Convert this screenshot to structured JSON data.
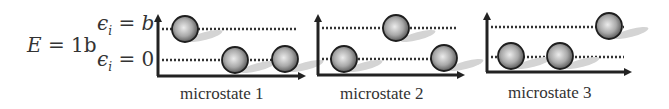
{
  "total_energy": {
    "symbol": "E",
    "equals": "=",
    "value": "1b"
  },
  "levels": [
    {
      "symbol": "ϵ",
      "subscript": "i",
      "equals": "=",
      "value": "b"
    },
    {
      "symbol": "ϵ",
      "subscript": "i",
      "equals": "=",
      "value": "0"
    }
  ],
  "microstates": [
    {
      "label": "microstate 1",
      "occupancy": {
        "upper": 1,
        "lower": 2
      }
    },
    {
      "label": "microstate 2",
      "occupancy": {
        "upper": 1,
        "lower": 2
      }
    },
    {
      "label": "microstate 3",
      "occupancy": {
        "upper": 1,
        "lower": 2
      }
    }
  ],
  "colors": {
    "axis": "#222222",
    "dotted_line": "#333333",
    "ball_edge": "#1e1e1e",
    "ball_center": "#e8e8e8",
    "shadow": "#d4d4d4"
  }
}
